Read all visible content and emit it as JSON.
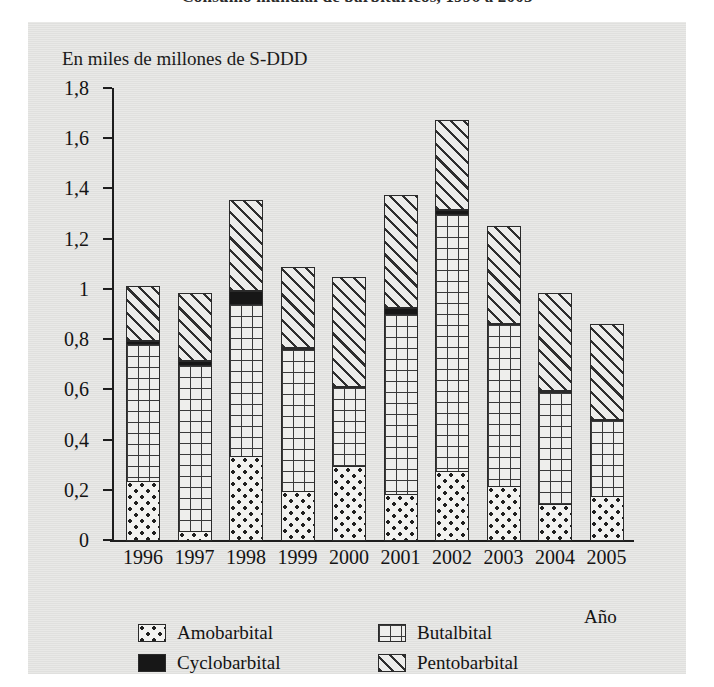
{
  "title": "Consumo mundial de barbitúricos, 1996 a 2005",
  "axis_note": "En miles de millones de S-DDD",
  "xaxis_title": "Año",
  "yticks": [
    "0",
    "0,2",
    "0,4",
    "0,6",
    "0,8",
    "1",
    "1,2",
    "1,4",
    "1,6",
    "1,8"
  ],
  "legend": [
    {
      "label": "Amobarbital",
      "pattern": "dotted",
      "key": "amobarbital"
    },
    {
      "label": "Butalbital",
      "pattern": "grid",
      "key": "butalbital"
    },
    {
      "label": "Cyclobarbital",
      "pattern": "solid-black",
      "key": "cyclobarbital"
    },
    {
      "label": "Pentobarbital",
      "pattern": "diagonal",
      "key": "pentobarbital"
    }
  ],
  "chart_data": {
    "type": "bar",
    "stacked": true,
    "title": "Consumo mundial de barbitúricos, 1996 a 2005",
    "xlabel": "Año",
    "ylabel": "En miles de millones de S-DDD",
    "ylim": [
      0,
      1.8
    ],
    "ytick_values": [
      0,
      0.2,
      0.4,
      0.6,
      0.8,
      1.0,
      1.2,
      1.4,
      1.6,
      1.8
    ],
    "ytick_labels": [
      "0",
      "0,2",
      "0,4",
      "0,6",
      "0,8",
      "1",
      "1,2",
      "1,4",
      "1,6",
      "1,8"
    ],
    "grid": false,
    "legend_position": "bottom",
    "categories": [
      "1996",
      "1997",
      "1998",
      "1999",
      "2000",
      "2001",
      "2002",
      "2003",
      "2004",
      "2005"
    ],
    "series": [
      {
        "name": "Amobarbital",
        "values": [
          0.24,
          0.04,
          0.34,
          0.2,
          0.3,
          0.19,
          0.28,
          0.22,
          0.15,
          0.18
        ]
      },
      {
        "name": "Butalbital",
        "values": [
          0.55,
          0.67,
          0.61,
          0.57,
          0.32,
          0.72,
          1.03,
          0.65,
          0.45,
          0.31
        ]
      },
      {
        "name": "Cyclobarbital",
        "values": [
          0.02,
          0.02,
          0.06,
          0.01,
          0.0,
          0.03,
          0.02,
          0.0,
          0.01,
          0.0
        ]
      },
      {
        "name": "Pentobarbital",
        "values": [
          0.22,
          0.27,
          0.36,
          0.32,
          0.44,
          0.45,
          0.36,
          0.39,
          0.39,
          0.38
        ]
      }
    ],
    "totals": [
      1.03,
      1.0,
      1.37,
      1.1,
      1.06,
      1.39,
      1.69,
      1.26,
      1.0,
      0.87
    ]
  }
}
